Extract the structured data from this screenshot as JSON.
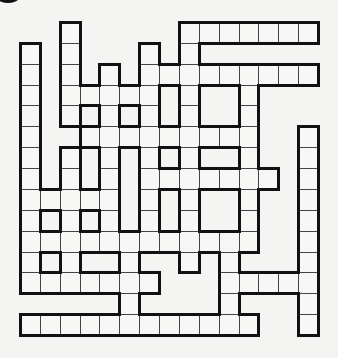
{
  "puzzle": {
    "type": "crossword-grid",
    "rows": 15,
    "cols": 15,
    "cell_width": 19.87,
    "cell_height": 20.87,
    "grid_rows": [
      "001000001111111",
      "101000101000000",
      "101010111111111",
      "101111101001000",
      "101010101001000",
      "100111111111001",
      "101010101001001",
      "101010111111101",
      "111110101001001",
      "101010101001001",
      "111111111111001",
      "101001001010001",
      "111111100011111",
      "000001000010001",
      "111111111111001"
    ],
    "colors": {
      "background": "#f4f4f2",
      "cell_fill": "#f7f7f5",
      "thin_line": "#444444",
      "thick_line": "#111111",
      "corner_marker": "#111111"
    }
  }
}
